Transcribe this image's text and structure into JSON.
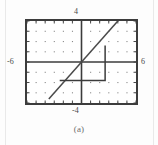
{
  "figure": {
    "caption": "(a)",
    "frame": {
      "x": 25,
      "y": 19,
      "width": 113,
      "height": 86,
      "border_color": "#3c3c3c"
    },
    "axis_labels": {
      "top": "4",
      "bottom": "-4",
      "left": "-6",
      "right": "6"
    },
    "icons": {
      "grid": "grid-dots-icon",
      "diagonal": "diagonal-line-icon",
      "staircase": "staircase-path-icon"
    }
  },
  "chart_data": {
    "type": "line",
    "title": "",
    "subtitle": "",
    "caption": "(a)",
    "xlabel": "",
    "ylabel": "",
    "xlim": [
      -6,
      6
    ],
    "ylim": [
      -4,
      4
    ],
    "xticks": [
      -6,
      -5,
      -4,
      -3,
      -2,
      -1,
      0,
      1,
      2,
      3,
      4,
      5,
      6
    ],
    "yticks": [
      -4,
      -3,
      -2,
      -1,
      0,
      1,
      2,
      3,
      4
    ],
    "xtick_labels": [
      "-6",
      "",
      "",
      "",
      "",
      "",
      "",
      "",
      "",
      "",
      "",
      "",
      "6"
    ],
    "ytick_labels": [
      "-4",
      "",
      "",
      "",
      "",
      "",
      "",
      "",
      "4"
    ],
    "grid": "dots",
    "grid_spacing": {
      "x": 1,
      "y": 1
    },
    "legend": "none",
    "legend_position": "none",
    "axes_style": "centered-cross-with-outer-box",
    "annotations": [],
    "series": [
      {
        "name": "y = x",
        "type": "line",
        "style": "solid",
        "color": "#4a4a4a",
        "x": [
          -6,
          6
        ],
        "y": [
          -6,
          6
        ],
        "clipped_to_window": true,
        "visible_endpoints": [
          [
            -3.6,
            -3.6
          ],
          [
            4.9,
            4.9
          ]
        ]
      },
      {
        "name": "staircase path",
        "type": "line",
        "style": "solid",
        "color": "#3c3c3c",
        "x": [
          -2.4,
          2.6,
          2.6
        ],
        "y": [
          -1.8,
          -1.8,
          1.6
        ],
        "closed": false
      }
    ]
  }
}
